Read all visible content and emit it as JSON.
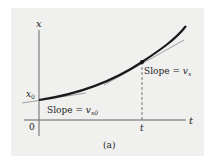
{
  "figure": {
    "panel_label": "(a)",
    "axes": {
      "y_label": "x",
      "x_label": "t",
      "origin_label": "0",
      "y_intercept_label": "x",
      "y_intercept_sub": "0",
      "t_marker_label": "t"
    },
    "annotations": {
      "slope_initial_text": "Slope = ",
      "slope_initial_var": "v",
      "slope_initial_sub": "x0",
      "slope_t_text": "Slope = ",
      "slope_t_var": "v",
      "slope_t_sub": "x"
    },
    "colors": {
      "background": "#f0f0ef",
      "curve": "#1a1a1a",
      "tangent": "#8a8a8a",
      "axis": "#555555"
    }
  }
}
